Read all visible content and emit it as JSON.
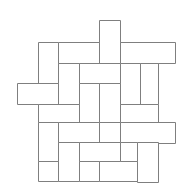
{
  "figure": {
    "name": "basketweave-tiling",
    "canvas": {
      "width": 188,
      "height": 195,
      "background": "#ffffff"
    },
    "style": {
      "stroke_color": "#7f7f7f",
      "stroke_width": 1,
      "fill_color": "#ffffff"
    },
    "grid": {
      "unit": 20.5,
      "x_lines": [
        17,
        38,
        58,
        79,
        99,
        120,
        140,
        158,
        175
      ],
      "y_lines": [
        20,
        42,
        63,
        83,
        104,
        122,
        142,
        161,
        181
      ]
    },
    "brick_count": 24,
    "bricks": [
      {
        "id": "b01",
        "orientation": "vertical",
        "x": 99,
        "y": 20,
        "w": 21,
        "h": 43
      },
      {
        "id": "b02",
        "orientation": "vertical",
        "x": 38,
        "y": 42,
        "w": 20,
        "h": 42
      },
      {
        "id": "b03",
        "orientation": "horizontal",
        "x": 58,
        "y": 42,
        "w": 41,
        "h": 21
      },
      {
        "id": "b04",
        "orientation": "horizontal",
        "x": 120,
        "y": 42,
        "w": 55,
        "h": 21
      },
      {
        "id": "b05",
        "orientation": "vertical",
        "x": 58,
        "y": 63,
        "w": 21,
        "h": 41
      },
      {
        "id": "b06",
        "orientation": "horizontal",
        "x": 79,
        "y": 63,
        "w": 41,
        "h": 20
      },
      {
        "id": "b07",
        "orientation": "vertical",
        "x": 120,
        "y": 63,
        "w": 20,
        "h": 41
      },
      {
        "id": "b08",
        "orientation": "vertical",
        "x": 140,
        "y": 63,
        "w": 18,
        "h": 41
      },
      {
        "id": "b09",
        "orientation": "horizontal",
        "x": 17,
        "y": 83,
        "w": 41,
        "h": 21
      },
      {
        "id": "b10",
        "orientation": "vertical",
        "x": 79,
        "y": 83,
        "w": 20,
        "h": 39
      },
      {
        "id": "b11",
        "orientation": "vertical",
        "x": 99,
        "y": 83,
        "w": 21,
        "h": 39
      },
      {
        "id": "b12",
        "orientation": "horizontal",
        "x": 38,
        "y": 104,
        "w": 41,
        "h": 18
      },
      {
        "id": "b13",
        "orientation": "horizontal",
        "x": 120,
        "y": 104,
        "w": 38,
        "h": 18
      },
      {
        "id": "b14",
        "orientation": "vertical",
        "x": 38,
        "y": 122,
        "w": 20,
        "h": 39
      },
      {
        "id": "b15",
        "orientation": "horizontal",
        "x": 58,
        "y": 122,
        "w": 41,
        "h": 20
      },
      {
        "id": "b16",
        "orientation": "vertical",
        "x": 99,
        "y": 122,
        "w": 21,
        "h": 39
      },
      {
        "id": "b17",
        "orientation": "horizontal",
        "x": 120,
        "y": 122,
        "w": 55,
        "h": 21
      },
      {
        "id": "b18",
        "orientation": "vertical",
        "x": 58,
        "y": 142,
        "w": 21,
        "h": 39
      },
      {
        "id": "b19",
        "orientation": "horizontal",
        "x": 79,
        "y": 142,
        "w": 41,
        "h": 19
      },
      {
        "id": "b20",
        "orientation": "vertical",
        "x": 137,
        "y": 142,
        "w": 21,
        "h": 40
      },
      {
        "id": "b21",
        "orientation": "horizontal",
        "x": 38,
        "y": 161,
        "w": 20,
        "h": 20
      },
      {
        "id": "b22",
        "orientation": "horizontal",
        "x": 79,
        "y": 161,
        "w": 20,
        "h": 20
      },
      {
        "id": "b23",
        "orientation": "horizontal",
        "x": 99,
        "y": 161,
        "w": 38,
        "h": 20
      },
      {
        "id": "b24",
        "orientation": "vertical",
        "x": 120,
        "y": 142,
        "w": 17,
        "h": 19
      }
    ]
  }
}
